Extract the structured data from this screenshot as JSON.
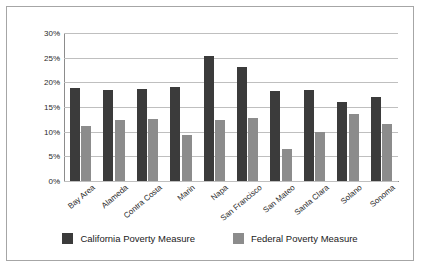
{
  "chart_data": {
    "type": "bar",
    "title": "",
    "subtitle": "",
    "xlabel": "",
    "ylabel": "",
    "ylim": [
      0,
      30
    ],
    "ytick_values": [
      0,
      5,
      10,
      15,
      20,
      25,
      30
    ],
    "ytick_labels": [
      "0%",
      "5%",
      "10%",
      "15%",
      "20%",
      "25%",
      "30%"
    ],
    "grid": true,
    "legend_position": "bottom",
    "categories": [
      "Bay Area",
      "Alameda",
      "Contra Costa",
      "Marin",
      "Napa",
      "San Francisco",
      "San Mateo",
      "Santa Clara",
      "Solano",
      "Sonoma"
    ],
    "series": [
      {
        "name": "California Poverty Measure",
        "color": "#3b3b3b",
        "values": [
          18.9,
          18.4,
          18.6,
          19.0,
          25.4,
          23.2,
          18.3,
          18.5,
          16.0,
          17.1
        ]
      },
      {
        "name": "Federal Poverty Measure",
        "color": "#8c8c8c",
        "values": [
          11.2,
          12.4,
          12.5,
          9.4,
          12.3,
          12.7,
          6.5,
          10.0,
          13.5,
          11.5
        ]
      }
    ]
  },
  "legend": {
    "items": [
      {
        "label": "California Poverty Measure",
        "color": "#3b3b3b"
      },
      {
        "label": "Federal Poverty Measure",
        "color": "#8c8c8c"
      }
    ]
  },
  "frame": {
    "border_color": "#a6a6a6",
    "background": "#ffffff"
  }
}
